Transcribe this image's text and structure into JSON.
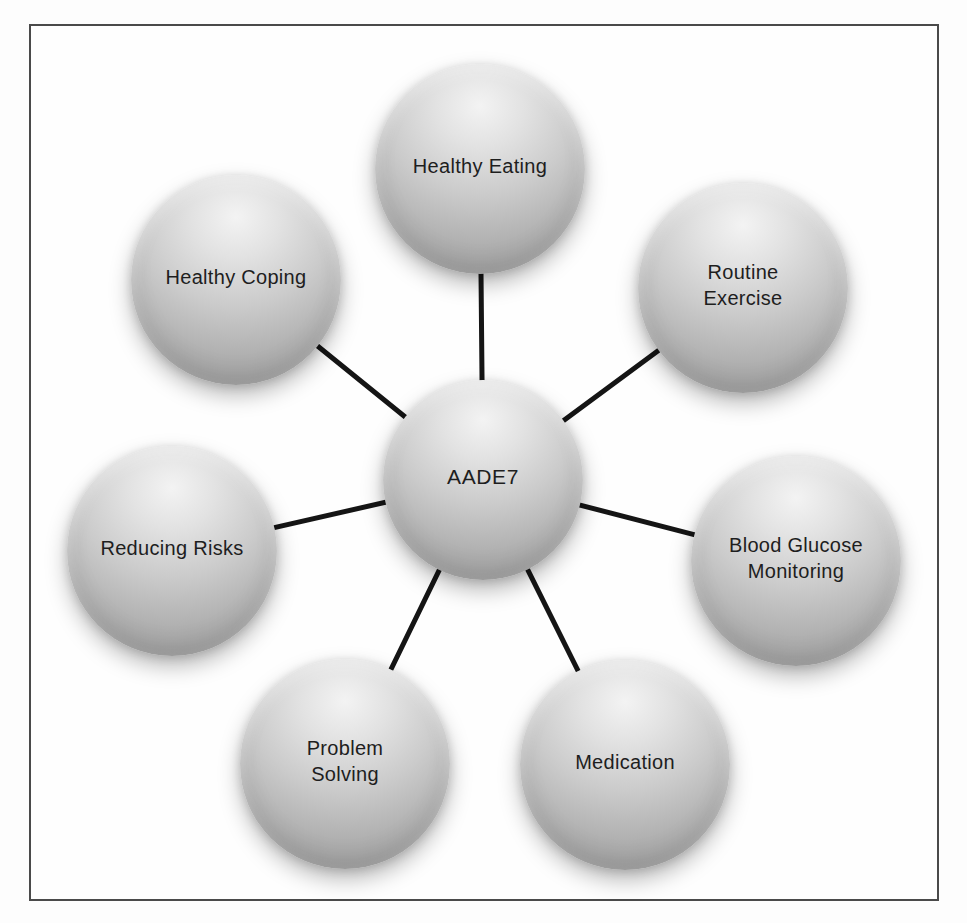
{
  "figure": {
    "hub": {
      "label": "AADE7"
    },
    "spokes": [
      {
        "label": "Healthy Eating"
      },
      {
        "label": "Routine\nExercise"
      },
      {
        "label": "Blood Glucose\nMonitoring"
      },
      {
        "label": "Medication"
      },
      {
        "label": "Problem\nSolving"
      },
      {
        "label": "Reducing Risks"
      },
      {
        "label": "Healthy Coping"
      }
    ],
    "colors": {
      "sphere_highlight": "#f3f3f3",
      "sphere_mid": "#c3c3c3",
      "sphere_edge": "#9a9a9a",
      "connector": "#151515",
      "text": "#1e1e1e",
      "frame_border": "#4a4a4a",
      "background": "#fdfdfd"
    }
  }
}
